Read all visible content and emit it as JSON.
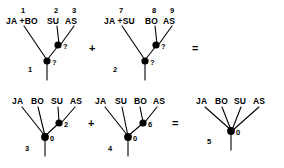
{
  "figure": {
    "type": "phylogenetic-tree-equation-diagram",
    "background_color": "#ffffff",
    "line_color": "#000000",
    "node_color": "#000000",
    "rows": [
      {
        "row_id": "top-row",
        "items": [
          {
            "kind": "tree",
            "tree_number": "1",
            "tips": [
              {
                "number": "1",
                "label": "JA +BO"
              },
              {
                "number": "2",
                "label": "SU"
              },
              {
                "number": "3",
                "label": "AS"
              }
            ],
            "nodes": [
              {
                "id": "inner",
                "label": "?"
              },
              {
                "id": "root",
                "label": "?"
              }
            ]
          },
          {
            "kind": "operator",
            "symbol": "+"
          },
          {
            "kind": "tree",
            "tree_number": "2",
            "tips": [
              {
                "number": "7",
                "label": "JA +SU"
              },
              {
                "number": "8",
                "label": "BO"
              },
              {
                "number": "9",
                "label": "AS"
              }
            ],
            "nodes": [
              {
                "id": "inner",
                "label": "?"
              },
              {
                "id": "root",
                "label": "?"
              }
            ]
          },
          {
            "kind": "operator",
            "symbol": "="
          }
        ]
      },
      {
        "row_id": "bottom-row",
        "items": [
          {
            "kind": "tree",
            "tree_number": "3",
            "tips": [
              {
                "number": "",
                "label": "JA"
              },
              {
                "number": "",
                "label": "BO"
              },
              {
                "number": "",
                "label": "SU"
              },
              {
                "number": "",
                "label": "AS"
              }
            ],
            "nodes": [
              {
                "id": "inner",
                "label": "2"
              },
              {
                "id": "root",
                "label": "0"
              }
            ]
          },
          {
            "kind": "operator",
            "symbol": "+"
          },
          {
            "kind": "tree",
            "tree_number": "4",
            "tips": [
              {
                "number": "",
                "label": "JA"
              },
              {
                "number": "",
                "label": "SU"
              },
              {
                "number": "",
                "label": "BO"
              },
              {
                "number": "",
                "label": "AS"
              }
            ],
            "nodes": [
              {
                "id": "inner",
                "label": "6"
              },
              {
                "id": "root",
                "label": "0"
              }
            ]
          },
          {
            "kind": "operator",
            "symbol": "="
          },
          {
            "kind": "tree",
            "tree_number": "5",
            "tips": [
              {
                "number": "",
                "label": "JA"
              },
              {
                "number": "",
                "label": "BO"
              },
              {
                "number": "",
                "label": "SU"
              },
              {
                "number": "",
                "label": "AS"
              }
            ],
            "nodes": [
              {
                "id": "root",
                "label": "0"
              }
            ]
          }
        ]
      }
    ]
  },
  "t1": {
    "num": "1",
    "tip1_num": "1",
    "tip1_label": "JA +BO",
    "tip2_num": "2",
    "tip2_label": "SU",
    "tip3_num": "3",
    "tip3_label": "AS",
    "node_inner": "?",
    "node_root": "?"
  },
  "t2": {
    "num": "2",
    "tip1_num": "7",
    "tip1_label": "JA +SU",
    "tip2_num": "8",
    "tip2_label": "BO",
    "tip3_num": "9",
    "tip3_label": "AS",
    "node_inner": "?",
    "node_root": "?"
  },
  "t3": {
    "num": "3",
    "tip1_label": "JA",
    "tip2_label": "BO",
    "tip3_label": "SU",
    "tip4_label": "AS",
    "node_inner": "2",
    "node_root": "0"
  },
  "t4": {
    "num": "4",
    "tip1_label": "JA",
    "tip2_label": "SU",
    "tip3_label": "BO",
    "tip4_label": "AS",
    "node_inner": "6",
    "node_root": "0"
  },
  "t5": {
    "num": "5",
    "tip1_label": "JA",
    "tip2_label": "BO",
    "tip3_label": "SU",
    "tip4_label": "AS",
    "node_root": "0"
  },
  "ops": {
    "plus_top": "+",
    "equals_top": "=",
    "plus_bottom": "+",
    "equals_bottom": "="
  }
}
